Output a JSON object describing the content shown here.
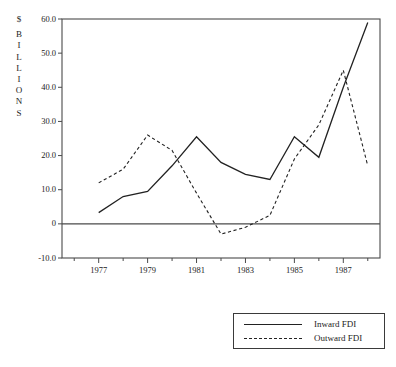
{
  "chart_data": {
    "type": "line",
    "title": "",
    "xlabel": "",
    "ylabel": "$ BILLIONS",
    "ylabel_chars": [
      "$",
      "B",
      "I",
      "L",
      "L",
      "I",
      "O",
      "N",
      "S"
    ],
    "xlim": [
      1975.5,
      1988.5
    ],
    "ylim": [
      -10.0,
      60.0
    ],
    "grid": false,
    "legend_position": "bottom-right",
    "x": [
      1976,
      1977,
      1978,
      1979,
      1980,
      1981,
      1982,
      1983,
      1984,
      1985,
      1986,
      1987,
      1988
    ],
    "xticks": [
      1977,
      1979,
      1981,
      1983,
      1985,
      1987
    ],
    "xtick_labels": [
      "1977",
      "1979",
      "1981",
      "1983",
      "1985",
      "1987"
    ],
    "yticks": [
      -10.0,
      0,
      10.0,
      20.0,
      30.0,
      40.0,
      50.0,
      60.0
    ],
    "ytick_labels": [
      "-10.0",
      "0",
      "10.0",
      "20.0",
      "30.0",
      "40.0",
      "50.0",
      "60.0"
    ],
    "zero_line": 0,
    "series": [
      {
        "name": "Inward FDI",
        "style": "solid",
        "color": "#222222",
        "x": [
          1977,
          1978,
          1979,
          1980,
          1981,
          1982,
          1983,
          1984,
          1985,
          1986,
          1987,
          1988
        ],
        "values": [
          3.3,
          8.0,
          9.5,
          17.0,
          25.5,
          18.0,
          14.5,
          13.0,
          25.5,
          19.5,
          40.0,
          59.0
        ]
      },
      {
        "name": "Outward FDI",
        "style": "dashed",
        "color": "#222222",
        "x": [
          1977,
          1978,
          1979,
          1980,
          1981,
          1982,
          1983,
          1984,
          1985,
          1986,
          1987,
          1988
        ],
        "values": [
          12.0,
          16.0,
          26.0,
          21.5,
          9.0,
          -3.0,
          -1.0,
          2.5,
          19.0,
          29.0,
          45.0,
          17.0
        ]
      }
    ]
  },
  "legend": {
    "entries": [
      {
        "label": "Inward FDI",
        "style": "solid"
      },
      {
        "label": "Outward FDI",
        "style": "dashed"
      }
    ]
  }
}
